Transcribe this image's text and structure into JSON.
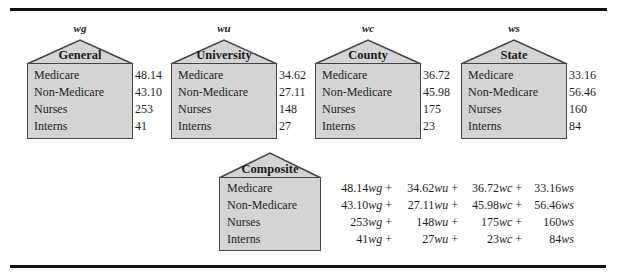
{
  "houses": [
    {
      "variable": "wg",
      "title": "General",
      "rows": [
        {
          "label": "Medicare",
          "value": "48.14"
        },
        {
          "label": "Non-Medicare",
          "value": "43.10"
        },
        {
          "label": "Nurses",
          "value": "253"
        },
        {
          "label": "Interns",
          "value": "41"
        }
      ]
    },
    {
      "variable": "wu",
      "title": "University",
      "rows": [
        {
          "label": "Medicare",
          "value": "34.62"
        },
        {
          "label": "Non-Medicare",
          "value": "27.11"
        },
        {
          "label": "Nurses",
          "value": "148"
        },
        {
          "label": "Interns",
          "value": "27"
        }
      ]
    },
    {
      "variable": "wc",
      "title": "County",
      "rows": [
        {
          "label": "Medicare",
          "value": "36.72"
        },
        {
          "label": "Non-Medicare",
          "value": "45.98"
        },
        {
          "label": "Nurses",
          "value": "175"
        },
        {
          "label": "Interns",
          "value": "23"
        }
      ]
    },
    {
      "variable": "ws",
      "title": "State",
      "rows": [
        {
          "label": "Medicare",
          "value": "33.16"
        },
        {
          "label": "Non-Medicare",
          "value": "56.46"
        },
        {
          "label": "Nurses",
          "value": "160"
        },
        {
          "label": "Interns",
          "value": "84"
        }
      ]
    }
  ],
  "composite": {
    "title": "Composite",
    "rows": [
      {
        "label": "Medicare",
        "terms": [
          {
            "coef": "48.14",
            "var": "wg",
            "op": " + "
          },
          {
            "coef": "34.62",
            "var": "wu",
            "op": " + "
          },
          {
            "coef": "36.72",
            "var": "wc",
            "op": " + "
          },
          {
            "coef": "33.16",
            "var": "ws",
            "op": ""
          }
        ]
      },
      {
        "label": "Non-Medicare",
        "terms": [
          {
            "coef": "43.10",
            "var": "wg",
            "op": " + "
          },
          {
            "coef": "27.11",
            "var": "wu",
            "op": " + "
          },
          {
            "coef": "45.98",
            "var": "wc",
            "op": " + "
          },
          {
            "coef": "56.46",
            "var": "ws",
            "op": ""
          }
        ]
      },
      {
        "label": "Nurses",
        "terms": [
          {
            "coef": "253",
            "var": "wg",
            "op": " + "
          },
          {
            "coef": "148",
            "var": "wu",
            "op": " + "
          },
          {
            "coef": "175",
            "var": "wc",
            "op": " + "
          },
          {
            "coef": "160",
            "var": "ws",
            "op": ""
          }
        ]
      },
      {
        "label": "Interns",
        "terms": [
          {
            "coef": "41",
            "var": "wg",
            "op": " + "
          },
          {
            "coef": "27",
            "var": "wu",
            "op": " + "
          },
          {
            "coef": "23",
            "var": "wc",
            "op": " + "
          },
          {
            "coef": "84",
            "var": "ws",
            "op": ""
          }
        ]
      }
    ]
  },
  "colors": {
    "box_fill": "#d4d4d4",
    "box_stroke": "#444444",
    "rule": "#111111"
  }
}
